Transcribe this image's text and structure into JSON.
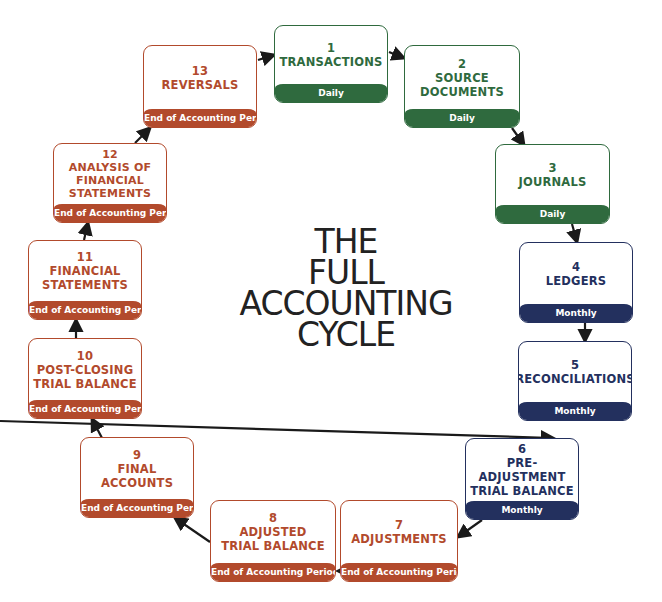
{
  "title": {
    "lines": [
      "THE",
      "FULL",
      "ACCOUNTING",
      "CYCLE"
    ]
  },
  "colors": {
    "daily": "#2f6a3e",
    "monthly": "#23305e",
    "end_of_period": "#b24a2c",
    "arrow": "#1a1a1a"
  },
  "steps": [
    {
      "num": "1",
      "title": "TRANSACTIONS",
      "frequency": "Daily"
    },
    {
      "num": "2",
      "title": "SOURCE\nDOCUMENTS",
      "frequency": "Daily"
    },
    {
      "num": "3",
      "title": "JOURNALS",
      "frequency": "Daily"
    },
    {
      "num": "4",
      "title": "LEDGERS",
      "frequency": "Monthly"
    },
    {
      "num": "5",
      "title": "RECONCILIATIONS",
      "frequency": "Monthly"
    },
    {
      "num": "6",
      "title": "PRE-ADJUSTMENT\nTRIAL BALANCE",
      "frequency": "Monthly"
    },
    {
      "num": "7",
      "title": "ADJUSTMENTS",
      "frequency": "End of Accounting Period"
    },
    {
      "num": "8",
      "title": "ADJUSTED\nTRIAL BALANCE",
      "frequency": "End of Accounting Period"
    },
    {
      "num": "9",
      "title": "FINAL\nACCOUNTS",
      "frequency": "End of Accounting Period"
    },
    {
      "num": "10",
      "title": "POST-CLOSING\nTRIAL BALANCE",
      "frequency": "End of Accounting Period"
    },
    {
      "num": "11",
      "title": "FINANCIAL\nSTATEMENTS",
      "frequency": "End of Accounting Period"
    },
    {
      "num": "12",
      "title": "ANALYSIS OF\nFINANCIAL\nSTATEMENTS",
      "frequency": "End of Accounting Period"
    },
    {
      "num": "13",
      "title": "REVERSALS",
      "frequency": "End of Accounting Period"
    }
  ]
}
